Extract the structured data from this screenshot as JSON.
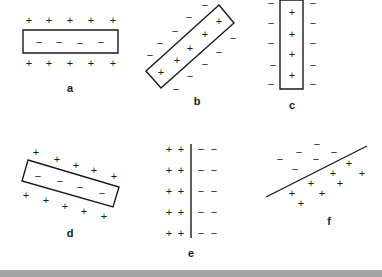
{
  "panels": {
    "a": {
      "label": "a",
      "shape": "rectangle-horizontal",
      "inside_charge": "−",
      "outside_charge": "+",
      "rect": [
        [
          23,
          30
        ],
        [
          118,
          30
        ],
        [
          118,
          53
        ],
        [
          23,
          53
        ]
      ],
      "plus": [
        [
          29,
          20
        ],
        [
          49,
          20
        ],
        [
          70,
          20
        ],
        [
          91,
          20
        ],
        [
          113,
          20
        ],
        [
          29,
          63
        ],
        [
          49,
          63
        ],
        [
          70,
          63
        ],
        [
          91,
          63
        ],
        [
          113,
          63
        ]
      ],
      "minus": [
        [
          39,
          42
        ],
        [
          59,
          42
        ],
        [
          80,
          43
        ],
        [
          101,
          42
        ]
      ],
      "label_pos": [
        70,
        88
      ]
    },
    "b": {
      "label": "b",
      "shape": "rectangle-diagonal",
      "inside_charge": "+",
      "outside_charge": "−",
      "rect": [
        [
          219,
          5
        ],
        [
          234,
          23
        ],
        [
          161,
          88
        ],
        [
          146,
          71
        ]
      ],
      "plus": [
        [
          219,
          21
        ],
        [
          205,
          34
        ],
        [
          190,
          48
        ],
        [
          177,
          60
        ],
        [
          161,
          72
        ]
      ],
      "minus": [
        [
          205,
          5
        ],
        [
          189,
          17
        ],
        [
          175,
          31
        ],
        [
          160,
          43
        ],
        [
          150,
          55
        ],
        [
          233,
          38
        ],
        [
          219,
          52
        ],
        [
          205,
          64
        ],
        [
          190,
          76
        ],
        [
          176,
          89
        ]
      ],
      "label_pos": [
        197,
        101
      ]
    },
    "c": {
      "label": "c",
      "shape": "rectangle-vertical",
      "inside_charge": "+",
      "outside_charge": "−",
      "rect": [
        [
          280,
          0
        ],
        [
          303,
          0
        ],
        [
          303,
          89
        ],
        [
          280,
          89
        ]
      ],
      "plus": [
        [
          292,
          12
        ],
        [
          292,
          34
        ],
        [
          292,
          54
        ],
        [
          292,
          75
        ]
      ],
      "minus": [
        [
          271,
          3
        ],
        [
          271,
          23
        ],
        [
          271,
          43
        ],
        [
          273,
          65
        ],
        [
          271,
          84
        ],
        [
          313,
          3
        ],
        [
          313,
          23
        ],
        [
          313,
          43
        ],
        [
          313,
          65
        ],
        [
          313,
          84
        ]
      ],
      "label_pos": [
        292,
        105
      ]
    },
    "d": {
      "label": "d",
      "shape": "rectangle-tilted",
      "inside_charge": "−",
      "outside_charge": "+",
      "rect": [
        [
          28,
          160
        ],
        [
          119,
          187
        ],
        [
          113,
          207
        ],
        [
          22,
          181
        ]
      ],
      "plus": [
        [
          36,
          152
        ],
        [
          57,
          159
        ],
        [
          76,
          165
        ],
        [
          94,
          170
        ],
        [
          114,
          176
        ],
        [
          26,
          195
        ],
        [
          46,
          200
        ],
        [
          65,
          206
        ],
        [
          84,
          211
        ],
        [
          104,
          216
        ]
      ],
      "minus": [
        [
          38,
          176
        ],
        [
          60,
          181
        ],
        [
          80,
          187
        ],
        [
          102,
          193
        ]
      ],
      "label_pos": [
        70,
        233
      ]
    },
    "e": {
      "label": "e",
      "shape": "vertical-line",
      "line": [
        [
          191,
          144
        ],
        [
          191,
          238
        ]
      ],
      "plus": [
        [
          169,
          149
        ],
        [
          181,
          149
        ],
        [
          169,
          170
        ],
        [
          181,
          170
        ],
        [
          169,
          191
        ],
        [
          181,
          191
        ],
        [
          169,
          212
        ],
        [
          181,
          212
        ],
        [
          169,
          233
        ],
        [
          181,
          233
        ]
      ],
      "minus": [
        [
          201,
          149
        ],
        [
          214,
          149
        ],
        [
          201,
          170
        ],
        [
          214,
          170
        ],
        [
          201,
          191
        ],
        [
          214,
          191
        ],
        [
          201,
          212
        ],
        [
          214,
          212
        ],
        [
          201,
          233
        ],
        [
          214,
          233
        ]
      ],
      "label_pos": [
        191,
        253
      ]
    },
    "f": {
      "label": "f",
      "shape": "diagonal-line",
      "line": [
        [
          266,
          197
        ],
        [
          367,
          146
        ]
      ],
      "plus": [
        [
          349,
          163
        ],
        [
          362,
          173
        ],
        [
          333,
          173
        ],
        [
          311,
          183
        ],
        [
          340,
          183
        ],
        [
          292,
          193
        ],
        [
          322,
          193
        ],
        [
          301,
          203
        ]
      ],
      "minus": [
        [
          317,
          144
        ],
        [
          299,
          152
        ],
        [
          334,
          152
        ],
        [
          280,
          159
        ],
        [
          316,
          159
        ],
        [
          295,
          169
        ]
      ],
      "label_pos": [
        329,
        221
      ]
    }
  },
  "symbols": {
    "plus": "+",
    "minus": "−"
  },
  "colors": {
    "ink": "#1a1a1a",
    "background": "#ffffff",
    "bottom_bar": "#a4a4a4"
  }
}
